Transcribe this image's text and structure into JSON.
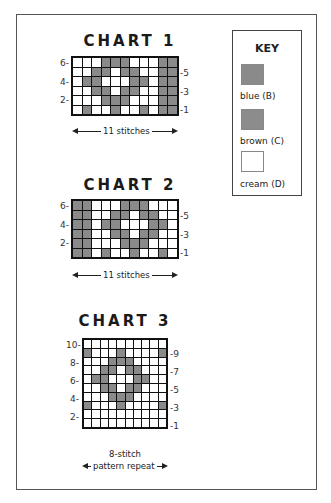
{
  "key": {
    "title": "KEY",
    "items": [
      {
        "label": "blue (B)",
        "color": "#8a8a8a"
      },
      {
        "label": "brown (C)",
        "color": "#8c8c8c"
      },
      {
        "label": "cream (D)",
        "color": "#ffffff"
      }
    ]
  },
  "charts": [
    {
      "title": "CHART 1",
      "cols": 11,
      "rows": 6,
      "left_labels": [
        "6-",
        "4-",
        "2-"
      ],
      "right_labels": [
        "-5",
        "-3",
        "-1"
      ],
      "width_label": "11 stitches",
      "grid": [
        "WWWGGGWWWGG",
        "WWGGWGGWWGG",
        "WGGWWWGGWGG",
        "WWGGWGGWWGG",
        "WWWGGGWWWGG",
        "WGWWGWWGWGG"
      ]
    },
    {
      "title": "CHART 2",
      "cols": 11,
      "rows": 6,
      "left_labels": [
        "6-",
        "4-",
        "2-"
      ],
      "right_labels": [
        "-5",
        "-3",
        "-1"
      ],
      "width_label": "11 stitches",
      "grid": [
        "GGWWWGGGWWW",
        "GGWWGGWGGWW",
        "GGWGGWWWGGW",
        "GGWWGGWGGWW",
        "GGWWWGGGWWW",
        "GGWGWWGWWGW"
      ]
    },
    {
      "title": "CHART 3",
      "cols": 10,
      "rows": 10,
      "left_labels": [
        "10-",
        "8-",
        "6-",
        "4-",
        "2-"
      ],
      "right_labels": [
        "-9",
        "-7",
        "-5",
        "-3",
        "-1"
      ],
      "repeat_label_line1": "8-stitch",
      "repeat_label_line2": "pattern repeat",
      "grid": [
        "WWWWWWWWWW",
        "GWWWGWWWWG",
        "WWWGGGWWWW",
        "WWGGWGGWWW",
        "WGGWWWGGWW",
        "WWGGWGGWWW",
        "WWWGGGWWWW",
        "GWWWGWWWWG",
        "WWWWWWWWWW",
        "WWWWWWWWWW"
      ]
    }
  ]
}
